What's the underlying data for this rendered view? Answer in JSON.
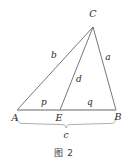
{
  "figure": {
    "caption": "图 2",
    "type": "geometry-diagram",
    "colors": {
      "stroke": "#4a4a4a",
      "base_stroke": "#9a9a9a",
      "brace_stroke": "#8a8a8a",
      "label": "#2a2a2a",
      "background": "#ffffff"
    },
    "vertices": [
      {
        "name": "C",
        "label": "C",
        "x": 93,
        "y": 27,
        "label_x": 93,
        "label_y": 14
      },
      {
        "name": "A",
        "label": "A",
        "x": 17,
        "y": 110,
        "label_x": 15,
        "label_y": 118
      },
      {
        "name": "E",
        "label": "E",
        "x": 60,
        "y": 110,
        "label_x": 59,
        "label_y": 118
      },
      {
        "name": "B",
        "label": "B",
        "x": 116,
        "y": 110,
        "label_x": 118,
        "label_y": 117
      }
    ],
    "segments": [
      {
        "name": "side-b-AC",
        "label": "b",
        "from": "A",
        "to": "C",
        "x1": 17,
        "y1": 110,
        "x2": 93,
        "y2": 27,
        "label_x": 54,
        "label_y": 55
      },
      {
        "name": "side-a-BC",
        "label": "a",
        "from": "B",
        "to": "C",
        "x1": 116,
        "y1": 110,
        "x2": 93,
        "y2": 27,
        "label_x": 108,
        "label_y": 57
      },
      {
        "name": "cevian-d-CE",
        "label": "d",
        "from": "C",
        "to": "E",
        "x1": 93,
        "y1": 27,
        "x2": 60,
        "y2": 110,
        "label_x": 79,
        "label_y": 79
      },
      {
        "name": "base-p-AE",
        "label": "p",
        "from": "A",
        "to": "E",
        "x1": 17,
        "y1": 110,
        "x2": 60,
        "y2": 110,
        "label_x": 44,
        "label_y": 102
      },
      {
        "name": "base-q-EB",
        "label": "q",
        "from": "E",
        "to": "B",
        "x1": 60,
        "y1": 110,
        "x2": 116,
        "y2": 110,
        "label_x": 90,
        "label_y": 102
      }
    ],
    "brace": {
      "name": "brace-c",
      "label": "c",
      "from_x": 17,
      "to_x": 116,
      "y": 122,
      "label_x": 66,
      "label_y": 135
    }
  }
}
